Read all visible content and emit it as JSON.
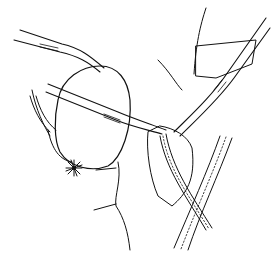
{
  "figure": {
    "kind": "surgical line illustration",
    "style": "black ink line art on white",
    "colors": {
      "background": "#ffffff",
      "ink": "#111111"
    },
    "elements": [
      "upper-left forceps",
      "middle-left forceps",
      "right forceps",
      "left clamp",
      "round organ (hatched)",
      "suture knot",
      "tissue flap (hatched)",
      "retracted tissue (horizontal hatch)",
      "tubular vessel left",
      "tubular vessel right",
      "body outline"
    ]
  }
}
